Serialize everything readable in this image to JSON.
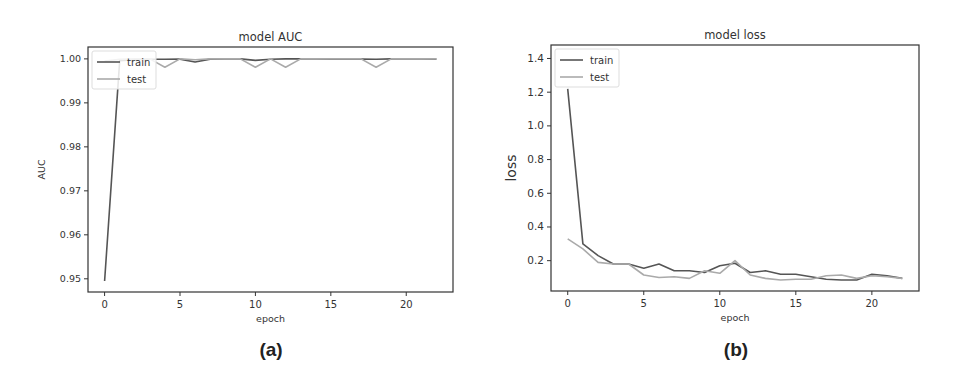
{
  "chart_data": [
    {
      "type": "line",
      "title": "model AUC",
      "xlabel": "epoch",
      "ylabel": "AUC",
      "caption": "(a)",
      "xlim": [
        -1.1,
        23.1
      ],
      "ylim": [
        0.947,
        1.0027
      ],
      "xticks": [
        0,
        5,
        10,
        15,
        20
      ],
      "yticks": [
        0.95,
        0.96,
        0.97,
        0.98,
        0.99,
        1.0
      ],
      "ytick_labels": [
        "0.95",
        "0.96",
        "0.97",
        "0.98",
        "0.99",
        "1.00"
      ],
      "grid": false,
      "legend_position": "upper left",
      "x": [
        0,
        1,
        2,
        3,
        4,
        5,
        6,
        7,
        8,
        9,
        10,
        11,
        12,
        13,
        14,
        15,
        16,
        17,
        18,
        19,
        20,
        21,
        22
      ],
      "series": [
        {
          "name": "train",
          "color": "#555555",
          "values": [
            0.9495,
            0.9996,
            0.9998,
            0.9999,
            0.9999,
            0.99995,
            0.9993,
            0.99995,
            1.0,
            1.0,
            0.99965,
            0.9999,
            1.0,
            1.0,
            1.0,
            0.99995,
            1.0,
            0.99995,
            0.9999,
            1.0,
            1.0,
            1.0,
            0.99995
          ]
        },
        {
          "name": "test",
          "color": "#aaaaaa",
          "values": [
            0.9995,
            0.9999,
            1.0,
            1.0,
            0.9981,
            1.0,
            0.9998,
            1.0,
            1.0,
            1.0,
            0.9981,
            1.0,
            0.9981,
            1.0,
            1.0,
            1.0,
            1.0,
            1.0,
            0.9981,
            1.0,
            1.0,
            1.0,
            1.0
          ]
        }
      ]
    },
    {
      "type": "line",
      "title": "model loss",
      "xlabel": "epoch",
      "ylabel": "loss",
      "caption": "(b)",
      "xlim": [
        -1.1,
        23.1
      ],
      "ylim": [
        0.02,
        1.48
      ],
      "xticks": [
        0,
        5,
        10,
        15,
        20
      ],
      "yticks": [
        0.2,
        0.4,
        0.6,
        0.8,
        1.0,
        1.2,
        1.4
      ],
      "ytick_labels": [
        "0.2",
        "0.4",
        "0.6",
        "0.8",
        "1.0",
        "1.2",
        "1.4"
      ],
      "grid": false,
      "legend_position": "upper left",
      "x": [
        0,
        1,
        2,
        3,
        4,
        5,
        6,
        7,
        8,
        9,
        10,
        11,
        12,
        13,
        14,
        15,
        16,
        17,
        18,
        19,
        20,
        21,
        22
      ],
      "series": [
        {
          "name": "train",
          "color": "#555555",
          "values": [
            1.22,
            0.3,
            0.23,
            0.18,
            0.18,
            0.155,
            0.18,
            0.14,
            0.14,
            0.13,
            0.17,
            0.185,
            0.13,
            0.14,
            0.12,
            0.12,
            0.105,
            0.09,
            0.085,
            0.085,
            0.12,
            0.11,
            0.095
          ]
        },
        {
          "name": "test",
          "color": "#aaaaaa",
          "values": [
            0.33,
            0.27,
            0.19,
            0.18,
            0.18,
            0.115,
            0.1,
            0.105,
            0.095,
            0.14,
            0.125,
            0.2,
            0.115,
            0.095,
            0.085,
            0.09,
            0.09,
            0.11,
            0.115,
            0.095,
            0.11,
            0.105,
            0.095
          ]
        }
      ]
    }
  ]
}
